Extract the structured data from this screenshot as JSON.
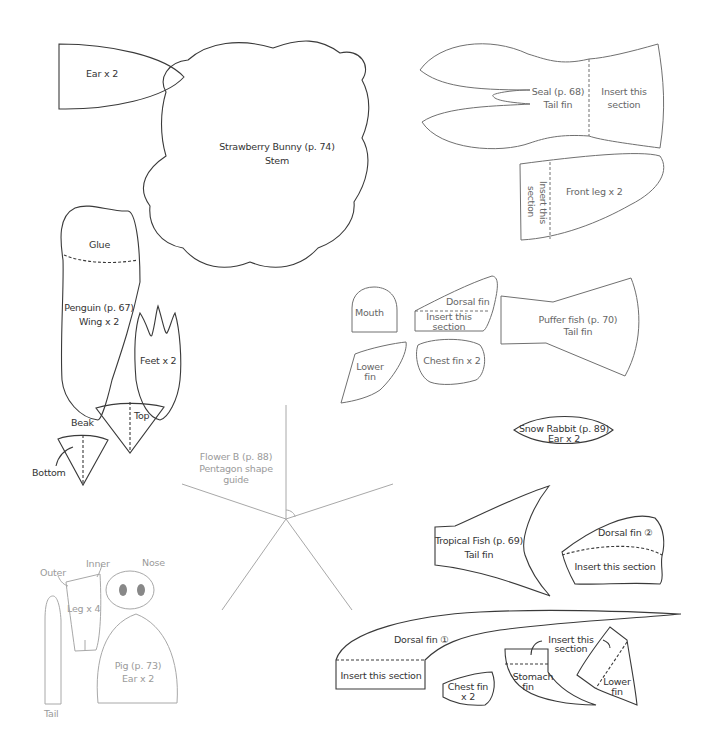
{
  "sheet": {
    "strawberry_bunny": {
      "ear": "Ear x 2",
      "stem_line1": "Strawberry Bunny (p. 74)",
      "stem_line2": "Stem"
    },
    "seal": {
      "tail_line1": "Seal (p. 68)",
      "tail_line2": "Tail fin",
      "tail_insert_line1": "Insert this",
      "tail_insert_line2": "section",
      "front_leg": "Front leg x 2",
      "front_leg_insert": "Insert this section"
    },
    "penguin": {
      "glue": "Glue",
      "wing_line1": "Penguin (p. 67)",
      "wing_line2": "Wing x 2",
      "feet": "Feet x 2",
      "beak": "Beak",
      "top": "Top",
      "bottom": "Bottom"
    },
    "puffer_fish": {
      "mouth": "Mouth",
      "dorsal_fin": "Dorsal fin",
      "dorsal_insert_line1": "Insert this",
      "dorsal_insert_line2": "section",
      "lower_fin_line1": "Lower",
      "lower_fin_line2": "fin",
      "chest_fin": "Chest fin x 2",
      "tail_line1": "Puffer fish (p. 70)",
      "tail_line2": "Tail fin"
    },
    "snow_rabbit": {
      "line1": "Snow Rabbit (p. 89)",
      "line2": "Ear x 2"
    },
    "flower_b": {
      "line1": "Flower B (p. 88)",
      "line2": "Pentagon shape",
      "line3": "guide"
    },
    "tropical_fish": {
      "tail_line1": "Tropical Fish (p. 69)",
      "tail_line2": "Tail fin",
      "dorsal2": "Dorsal fin ②",
      "dorsal2_insert": "Insert this section",
      "dorsal1": "Dorsal fin ①",
      "dorsal1_insert": "Insert this section",
      "chest_fin_line1": "Chest fin",
      "chest_fin_line2": "x 2",
      "stomach_insert_line1": "Insert this",
      "stomach_insert_line2": "section",
      "stomach_line1": "Stomach",
      "stomach_line2": "fin",
      "lower_fin_line1": "Lower",
      "lower_fin_line2": "fin"
    },
    "pig": {
      "outer": "Outer",
      "inner": "Inner",
      "nose": "Nose",
      "leg": "Leg x 4",
      "ear_line1": "Pig (p. 73)",
      "ear_line2": "Ear x 2",
      "tail": "Tail"
    }
  },
  "colors": {
    "outline_dark": "#3a3a3a",
    "outline_mid": "#707070",
    "outline_light": "#a8a8a8",
    "nostril": "#888888"
  }
}
